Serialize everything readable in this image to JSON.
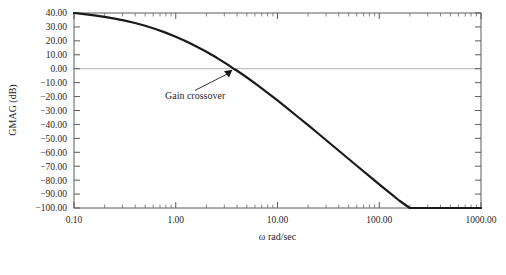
{
  "figure": {
    "background": "#ffffff",
    "plot_frame_color": "#5a5a5a",
    "curve_color": "#1a1a1a",
    "zero_line_color": "#b3b3b3"
  },
  "chart_data": {
    "type": "line",
    "title": "",
    "xlabel": "ω rad/sec",
    "ylabel": "GMAG (dB)",
    "xscale": "log",
    "xlim": [
      0.1,
      1000
    ],
    "ylim": [
      -100,
      40
    ],
    "grid": false,
    "legend": null,
    "xticks": [
      0.1,
      1,
      10,
      100,
      1000
    ],
    "xtick_labels": [
      "0.10",
      "1.00",
      "10.00",
      "100.00",
      "1000.00"
    ],
    "yticks": [
      40,
      30,
      20,
      10,
      0,
      -10,
      -20,
      -30,
      -40,
      -50,
      -60,
      -70,
      -80,
      -90,
      -100
    ],
    "ytick_labels": [
      "40.00",
      "30.00",
      "20.00",
      "10.00",
      "0.00",
      "-10.00",
      "-20.00",
      "-30.00",
      "-40.00",
      "-50.00",
      "-60.00",
      "-70.00",
      "-80.00",
      "-90.00",
      "-100.00"
    ],
    "minor_ticks": "log decade subdivisions 2-9 on x axis",
    "reference_lines": [
      {
        "name": "zero-db-line",
        "orientation": "horizontal",
        "y": 0,
        "color": "#b3b3b3"
      }
    ],
    "annotations": [
      {
        "name": "gain-crossover-annotation",
        "text": "Gain crossover",
        "point_x": 3.7,
        "point_y": 0.0,
        "text_x": 1.55,
        "text_y": -22.0
      }
    ],
    "series": [
      {
        "name": "GMAG",
        "x": [
          0.1,
          0.126,
          0.158,
          0.2,
          0.251,
          0.316,
          0.398,
          0.501,
          0.631,
          0.794,
          1.0,
          1.26,
          1.58,
          2.0,
          2.51,
          3.16,
          3.7,
          3.98,
          5.01,
          6.31,
          7.94,
          10.0,
          12.6,
          15.8,
          20.0,
          25.1,
          31.6,
          39.8,
          50.1,
          63.1,
          79.4,
          100.0,
          126.0,
          158.0,
          200.0,
          251.0,
          316.0,
          398.0,
          501.0,
          631.0,
          794.0,
          1000.0
        ],
        "y": [
          40.0,
          39.2,
          38.3,
          37.2,
          36.0,
          34.5,
          32.8,
          30.8,
          28.5,
          25.9,
          23.0,
          19.7,
          16.1,
          12.2,
          8.0,
          3.5,
          0.0,
          -1.3,
          -6.3,
          -11.6,
          -17.1,
          -22.8,
          -28.6,
          -34.5,
          -40.5,
          -46.5,
          -52.6,
          -58.7,
          -64.8,
          -70.9,
          -77.0,
          -83.0,
          -89.0,
          -94.8,
          -100.0,
          -100.0,
          -100.0,
          -100.0,
          -100.0,
          -100.0,
          -100.0,
          -100.0
        ],
        "color": "#1a1a1a",
        "linewidth": 2.2,
        "asymptotic_slope_db_per_decade": -40
      }
    ]
  }
}
